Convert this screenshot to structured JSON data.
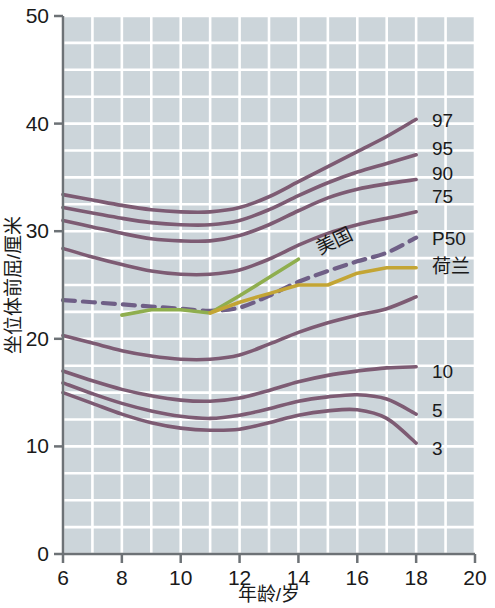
{
  "chart_data": {
    "type": "line",
    "title": "",
    "xlabel": "年龄/岁",
    "ylabel": "坐位体前屈/厘米",
    "xlim": [
      6,
      20
    ],
    "ylim": [
      0,
      50
    ],
    "x_ticks": [
      "6",
      "8",
      "10",
      "12",
      "14",
      "16",
      "18",
      "20"
    ],
    "y_ticks": [
      "0",
      "10",
      "20",
      "30",
      "40",
      "50"
    ],
    "grid": true,
    "grid_x_step": 1,
    "grid_y_step": 2.5,
    "legend_position": "right-inline",
    "plot_background": "#ccd5da",
    "grid_color": "#ffffff",
    "series": [
      {
        "name": "97",
        "label": "97",
        "color": "#7d5b73",
        "style": "solid",
        "x": [
          6,
          7,
          8,
          9,
          10,
          11,
          12,
          13,
          14,
          15,
          16,
          17,
          18
        ],
        "values": [
          33.4,
          32.9,
          32.4,
          32.0,
          31.8,
          31.8,
          32.2,
          33.2,
          34.6,
          36.0,
          37.4,
          38.8,
          40.4
        ]
      },
      {
        "name": "95",
        "label": "95",
        "color": "#7d5b73",
        "style": "solid",
        "x": [
          6,
          7,
          8,
          9,
          10,
          11,
          12,
          13,
          14,
          15,
          16,
          17,
          18
        ],
        "values": [
          32.2,
          31.7,
          31.2,
          30.8,
          30.6,
          30.6,
          31.0,
          32.0,
          33.3,
          34.5,
          35.5,
          36.3,
          37.1
        ]
      },
      {
        "name": "90",
        "label": "90",
        "color": "#7d5b73",
        "style": "solid",
        "x": [
          6,
          7,
          8,
          9,
          10,
          11,
          12,
          13,
          14,
          15,
          16,
          17,
          18
        ],
        "values": [
          31.0,
          30.4,
          29.8,
          29.3,
          29.1,
          29.1,
          29.6,
          30.6,
          31.9,
          33.1,
          33.9,
          34.4,
          34.8
        ]
      },
      {
        "name": "75",
        "label": "75",
        "color": "#7d5b73",
        "style": "solid",
        "x": [
          6,
          7,
          8,
          9,
          10,
          11,
          12,
          13,
          14,
          15,
          16,
          17,
          18
        ],
        "values": [
          28.4,
          27.6,
          26.9,
          26.3,
          26.0,
          26.0,
          26.4,
          27.4,
          28.7,
          29.8,
          30.6,
          31.2,
          31.8
        ]
      },
      {
        "name": "P50",
        "label": "P50",
        "color": "#6f5f86",
        "style": "dashed",
        "x": [
          6,
          7,
          8,
          9,
          10,
          11,
          12,
          13,
          14,
          15,
          16,
          17,
          18
        ],
        "values": [
          23.6,
          23.4,
          23.2,
          23.0,
          22.8,
          22.6,
          22.9,
          24.0,
          25.3,
          26.3,
          27.2,
          28.0,
          29.4
        ]
      },
      {
        "name": "美国",
        "label": "美国",
        "color": "#8fae4e",
        "style": "solid",
        "x": [
          8,
          9,
          10,
          11,
          12,
          13,
          14
        ],
        "values": [
          22.2,
          22.7,
          22.7,
          22.4,
          24.0,
          25.7,
          27.4
        ]
      },
      {
        "name": "荷兰",
        "label": "荷兰",
        "color": "#c3a534",
        "style": "solid",
        "x": [
          11,
          12,
          13,
          14,
          15,
          16,
          17,
          18
        ],
        "values": [
          22.4,
          23.4,
          24.2,
          25.0,
          25.0,
          26.1,
          26.6,
          26.6
        ]
      },
      {
        "name": "25",
        "label": "",
        "color": "#7d5b73",
        "style": "solid",
        "x": [
          6,
          7,
          8,
          9,
          10,
          11,
          12,
          13,
          14,
          15,
          16,
          17,
          18
        ],
        "values": [
          20.3,
          19.6,
          18.9,
          18.4,
          18.1,
          18.1,
          18.5,
          19.5,
          20.6,
          21.5,
          22.2,
          22.8,
          23.9
        ]
      },
      {
        "name": "10",
        "label": "10",
        "color": "#7d5b73",
        "style": "solid",
        "x": [
          6,
          7,
          8,
          9,
          10,
          11,
          12,
          13,
          14,
          15,
          16,
          17,
          18
        ],
        "values": [
          17.0,
          16.1,
          15.3,
          14.7,
          14.3,
          14.2,
          14.5,
          15.2,
          16.0,
          16.6,
          17.0,
          17.3,
          17.4
        ]
      },
      {
        "name": "5",
        "label": "5",
        "color": "#7d5b73",
        "style": "solid",
        "x": [
          6,
          7,
          8,
          9,
          10,
          11,
          12,
          13,
          14,
          15,
          16,
          17,
          18
        ],
        "values": [
          15.9,
          14.9,
          14.0,
          13.3,
          12.8,
          12.6,
          12.9,
          13.5,
          14.2,
          14.6,
          14.8,
          14.4,
          13.0
        ]
      },
      {
        "name": "3",
        "label": "3",
        "color": "#7d5b73",
        "style": "solid",
        "x": [
          6,
          7,
          8,
          9,
          10,
          11,
          12,
          13,
          14,
          15,
          16,
          17,
          18
        ],
        "values": [
          15.0,
          14.0,
          13.0,
          12.2,
          11.7,
          11.5,
          11.6,
          12.2,
          12.9,
          13.3,
          13.4,
          12.6,
          10.3
        ]
      }
    ],
    "inline_labels": [
      {
        "text": "97",
        "x": 432,
        "y": 127
      },
      {
        "text": "95",
        "x": 432,
        "y": 155
      },
      {
        "text": "90",
        "x": 432,
        "y": 180
      },
      {
        "text": "75",
        "x": 432,
        "y": 203
      },
      {
        "text": "P50",
        "x": 432,
        "y": 245
      },
      {
        "text": "荷兰",
        "x": 432,
        "y": 273
      },
      {
        "text": "10",
        "x": 432,
        "y": 378
      },
      {
        "text": "5",
        "x": 432,
        "y": 417
      },
      {
        "text": "3",
        "x": 432,
        "y": 455
      },
      {
        "text": "美国",
        "x": 320,
        "y": 255
      }
    ]
  }
}
